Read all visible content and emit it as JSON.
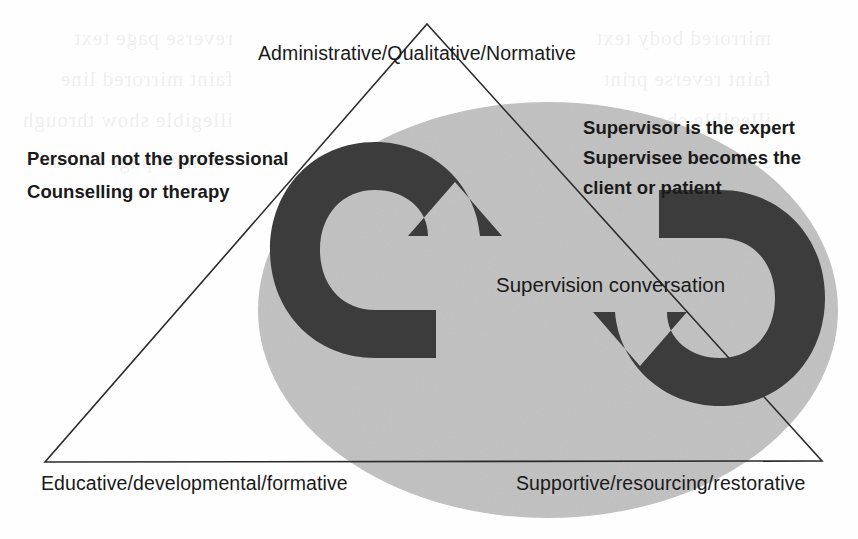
{
  "diagram": {
    "type": "venn-triangle-overlay",
    "colors": {
      "ellipse_fill": "#c3c3c3",
      "arrow_fill": "#3c3c3c",
      "triangle_stroke": "#2b2b2b",
      "background": "#fefefe",
      "text": "#1a1a1a"
    },
    "triangle": {
      "apex": {
        "x": 427,
        "y": 24
      },
      "bottom_left": {
        "x": 45,
        "y": 462
      },
      "bottom_right": {
        "x": 822,
        "y": 461
      },
      "stroke_width": 1.6
    },
    "ellipse": {
      "cx": 548,
      "cy": 310,
      "rx": 290,
      "ry": 208
    },
    "vertex_labels": {
      "apex": "Administrative/Qualitative/Normative",
      "bottom_left": "Educative/developmental/formative",
      "bottom_right": "Supportive/resourcing/restorative"
    },
    "notes": {
      "left": [
        "Personal not the professional",
        "Counselling or therapy"
      ],
      "right": [
        "Supervisor is the expert",
        "Supervisee becomes the",
        "client or patient"
      ]
    },
    "center_label": "Supervision conversation",
    "arrows": [
      {
        "name": "left-cycle-arrow",
        "shape": "c-shaped-curved-arrow",
        "opening": "right",
        "head": "top-right"
      },
      {
        "name": "right-cycle-arrow",
        "shape": "reverse-c-shaped-curved-arrow",
        "opening": "left",
        "head": "bottom-left"
      }
    ],
    "scan_bleed_through": {
      "visible": true,
      "description": "faint mirrored show-through text from reverse page",
      "lines_left": [
        "reverse page text",
        "faint mirrored line",
        "illegible show through",
        "scanned page bleed"
      ],
      "lines_right": [
        "mirrored body text",
        "faint reverse print",
        "illegible show through",
        "scanned page bleed"
      ]
    }
  }
}
